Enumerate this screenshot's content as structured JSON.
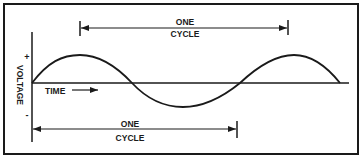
{
  "diagram": {
    "top_label": {
      "line1": "ONE",
      "line2": "CYCLE"
    },
    "bottom_label": {
      "line1": "ONE",
      "line2": "CYCLE"
    },
    "y_axis_label": "VOLTAGE",
    "plus_sign": "+",
    "minus_sign": "-",
    "time_label": "TIME",
    "colors": {
      "line": "#1a1a1a",
      "background": "#ffffff"
    }
  }
}
